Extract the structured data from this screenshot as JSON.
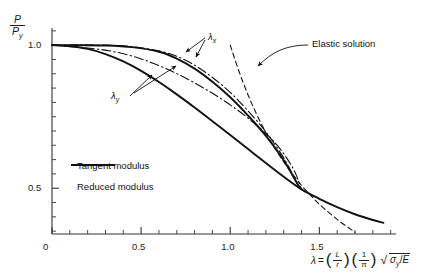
{
  "chart_data": {
    "type": "line",
    "title": "",
    "xlabel_parts": {
      "lambda": "λ",
      "equals": "=",
      "term1_num": "L",
      "term1_den": "r",
      "term2_num": "1",
      "term2_den": "π",
      "radicand_sigma": "σ",
      "radicand_sigma_sub": "y",
      "radicand_div": "/",
      "radicand_E": "E"
    },
    "ylabel_parts": {
      "num": "P",
      "den": "P",
      "den_sub": "y"
    },
    "xlim": [
      0,
      1.93
    ],
    "ylim": [
      0.34,
      1.06
    ],
    "xticks_major": [
      0,
      0.5,
      1.0,
      1.5
    ],
    "xticklabels": [
      "0",
      "0.5",
      "1.0",
      "1.5"
    ],
    "xtick_minor_step": 0.1,
    "yticks_major": [
      0.5,
      1.0
    ],
    "yticklabels": [
      "0.5",
      "1.0"
    ],
    "ytick_minor_step": 0.05,
    "grid": false,
    "legend_position": "inside-lower-left",
    "series": [
      {
        "name": "Tangent modulus",
        "style": "solid",
        "points": [
          [
            0.0,
            1.0
          ],
          [
            0.1,
            0.996
          ],
          [
            0.2,
            0.987
          ],
          [
            0.3,
            0.969
          ],
          [
            0.4,
            0.943
          ],
          [
            0.5,
            0.91
          ],
          [
            0.6,
            0.871
          ],
          [
            0.7,
            0.828
          ],
          [
            0.8,
            0.782
          ],
          [
            0.9,
            0.734
          ],
          [
            1.0,
            0.686
          ],
          [
            1.1,
            0.637
          ],
          [
            1.2,
            0.588
          ],
          [
            1.3,
            0.54
          ],
          [
            1.4,
            0.496
          ],
          [
            1.5,
            0.463
          ],
          [
            1.6,
            0.434
          ],
          [
            1.7,
            0.409
          ],
          [
            1.8,
            0.389
          ],
          [
            1.86,
            0.379
          ]
        ]
      },
      {
        "name": "Reduced modulus",
        "style": "dashdot",
        "points": [
          [
            0.0,
            1.0
          ],
          [
            0.15,
            1.001
          ],
          [
            0.3,
            1.0
          ],
          [
            0.45,
            0.995
          ],
          [
            0.6,
            0.98
          ],
          [
            0.7,
            0.961
          ],
          [
            0.8,
            0.93
          ],
          [
            0.9,
            0.887
          ],
          [
            1.0,
            0.835
          ],
          [
            1.1,
            0.77
          ],
          [
            1.2,
            0.697
          ],
          [
            1.3,
            0.606
          ],
          [
            1.38,
            0.512
          ],
          [
            1.4,
            0.496
          ]
        ]
      },
      {
        "name": "lambda-x upper",
        "style": "solid",
        "points": [
          [
            0.0,
            1.0
          ],
          [
            0.15,
            1.0
          ],
          [
            0.3,
            0.999
          ],
          [
            0.45,
            0.993
          ],
          [
            0.6,
            0.977
          ],
          [
            0.7,
            0.953
          ],
          [
            0.8,
            0.918
          ],
          [
            0.9,
            0.872
          ],
          [
            1.0,
            0.818
          ],
          [
            1.1,
            0.754
          ],
          [
            1.2,
            0.683
          ],
          [
            1.3,
            0.598
          ],
          [
            1.38,
            0.512
          ],
          [
            1.4,
            0.496
          ]
        ]
      },
      {
        "name": "lambda-y reduced",
        "style": "dashdot",
        "points": [
          [
            0.0,
            1.0
          ],
          [
            0.2,
            0.99
          ],
          [
            0.35,
            0.977
          ],
          [
            0.5,
            0.952
          ],
          [
            0.65,
            0.915
          ],
          [
            0.8,
            0.868
          ],
          [
            0.95,
            0.812
          ],
          [
            1.1,
            0.745
          ],
          [
            1.25,
            0.66
          ],
          [
            1.35,
            0.572
          ],
          [
            1.4,
            0.496
          ]
        ]
      },
      {
        "name": "Elastic solution",
        "style": "dashed",
        "points": [
          [
            1.0,
            1.0
          ],
          [
            1.05,
            0.907
          ],
          [
            1.1,
            0.826
          ],
          [
            1.15,
            0.756
          ],
          [
            1.2,
            0.694
          ],
          [
            1.25,
            0.64
          ],
          [
            1.3,
            0.592
          ],
          [
            1.35,
            0.549
          ],
          [
            1.4,
            0.51
          ],
          [
            1.45,
            0.476
          ],
          [
            1.5,
            0.444
          ],
          [
            1.6,
            0.391
          ],
          [
            1.7,
            0.346
          ]
        ]
      }
    ],
    "annotations": [
      {
        "name": "lambda-x",
        "text": "λ",
        "sub": "x"
      },
      {
        "name": "lambda-y",
        "text": "λ",
        "sub": "y"
      },
      {
        "name": "elastic-solution",
        "text": "Elastic solution"
      }
    ],
    "legend_entries": [
      {
        "label": "Tangent modulus",
        "style": "solid"
      },
      {
        "label": "Reduced modulus",
        "style": "dashdot"
      }
    ]
  }
}
